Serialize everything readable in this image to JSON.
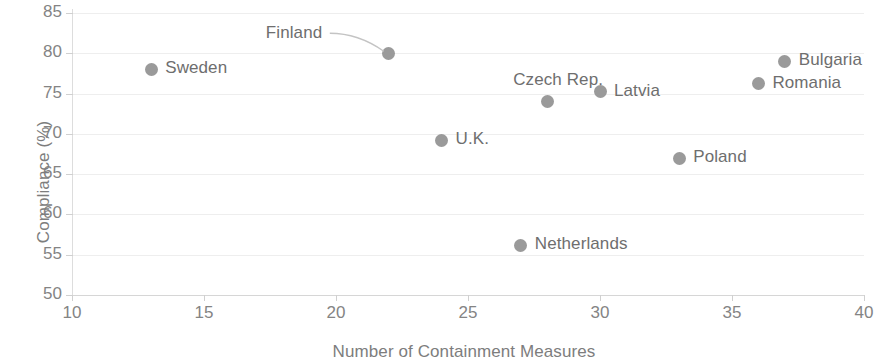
{
  "chart_data": {
    "type": "scatter",
    "title": "",
    "xlabel": "Number of Containment Measures",
    "ylabel": "Compliance (%)",
    "xlim": [
      10,
      40
    ],
    "ylim": [
      50,
      85
    ],
    "xticks": [
      10,
      15,
      20,
      25,
      30,
      35,
      40
    ],
    "yticks": [
      50,
      55,
      60,
      65,
      70,
      75,
      80,
      85
    ],
    "grid": "horizontal",
    "legend": "none",
    "marker_color": "#9a9a9a",
    "label_color": "#6e6e6e",
    "gridline_color": "#eeeeee",
    "points": [
      {
        "label": "Sweden",
        "x": 13,
        "y": 78,
        "label_pos": "right"
      },
      {
        "label": "Finland",
        "x": 22,
        "y": 80,
        "label_pos": "leader-left"
      },
      {
        "label": "Czech Rep.",
        "x": 28,
        "y": 74,
        "label_pos": "above"
      },
      {
        "label": "Latvia",
        "x": 30,
        "y": 75.2,
        "label_pos": "right"
      },
      {
        "label": "U.K.",
        "x": 24,
        "y": 69.2,
        "label_pos": "right"
      },
      {
        "label": "Netherlands",
        "x": 27,
        "y": 56.2,
        "label_pos": "right"
      },
      {
        "label": "Poland",
        "x": 33,
        "y": 67,
        "label_pos": "right"
      },
      {
        "label": "Bulgaria",
        "x": 37,
        "y": 79,
        "label_pos": "right"
      },
      {
        "label": "Romania",
        "x": 36,
        "y": 76.2,
        "label_pos": "right"
      }
    ]
  }
}
